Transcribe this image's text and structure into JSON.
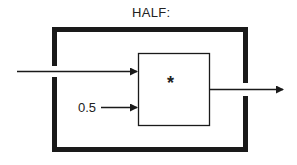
{
  "diagram": {
    "title": "HALF:",
    "constant_input": "0.5",
    "operator": "*",
    "colors": {
      "stroke": "#1a1a1a",
      "background": "#ffffff"
    }
  }
}
